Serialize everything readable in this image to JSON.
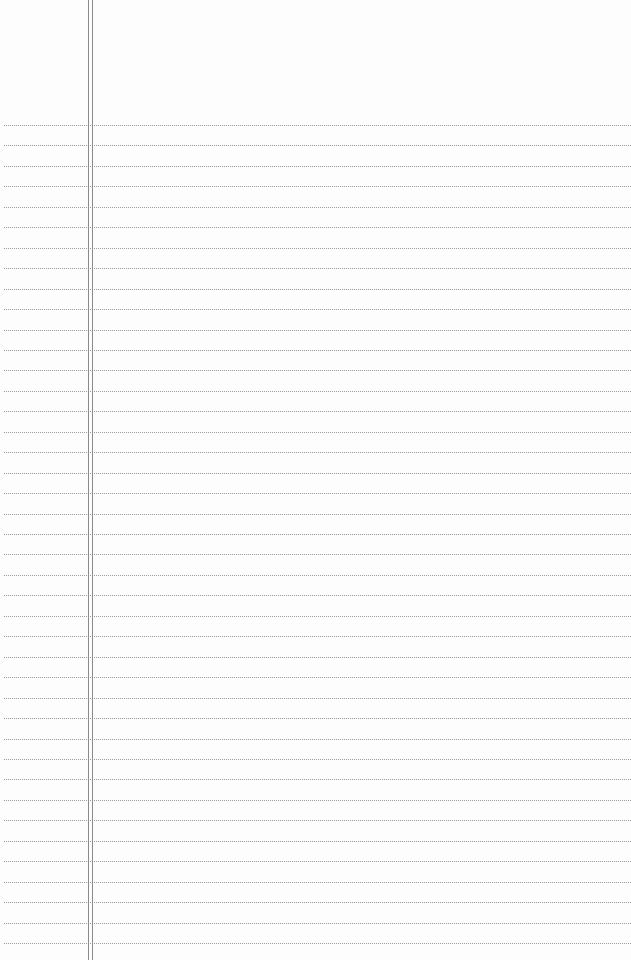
{
  "paper": {
    "type": "lined-notepaper",
    "background_color": "#fdfdfd",
    "rule_color": "#9a9a9a",
    "margin_line_color": "#8a8a8a",
    "first_rule_y": 125,
    "rule_spacing": 20.45,
    "rule_count": 41,
    "margin_lines_x": [
      88,
      92
    ],
    "text": ""
  }
}
